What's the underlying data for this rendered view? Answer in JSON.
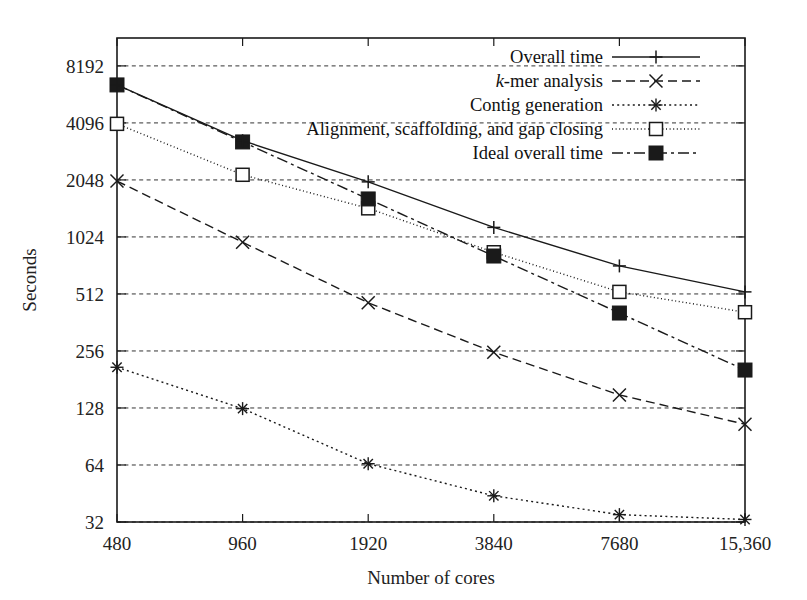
{
  "chart_data": {
    "type": "line",
    "title": "",
    "xlabel": "Number of cores",
    "ylabel": "Seconds",
    "xscale": "log2",
    "yscale": "log2",
    "grid": true,
    "legend_position": "top-right",
    "x": [
      480,
      960,
      1920,
      3840,
      7680,
      15360
    ],
    "xtick_labels": [
      "480",
      "960",
      "1920",
      "3840",
      "7680",
      "15,360"
    ],
    "ytick_values": [
      32,
      64,
      128,
      256,
      512,
      1024,
      2048,
      4096,
      8192
    ],
    "ytick_labels": [
      "32",
      "64",
      "128",
      "256",
      "512",
      "1024",
      "2048",
      "4096",
      "8192"
    ],
    "ylim": [
      32,
      11500
    ],
    "series": [
      {
        "name": "Overall time",
        "marker": "plus",
        "linestyle": "solid",
        "values": [
          6500,
          3300,
          2000,
          1150,
          720,
          525
        ]
      },
      {
        "name": "k-mer analysis",
        "marker": "cross",
        "linestyle": "dashed",
        "values": [
          2020,
          960,
          460,
          252,
          150,
          105
        ]
      },
      {
        "name": "Contig generation",
        "marker": "asterisk",
        "linestyle": "dotted",
        "values": [
          210,
          127,
          65,
          44,
          35,
          33
        ]
      },
      {
        "name": "Alignment, scaffolding, and gap closing",
        "marker": "open-square",
        "linestyle": "fine-dotted",
        "values": [
          4050,
          2180,
          1450,
          850,
          525,
          410
        ]
      },
      {
        "name": "Ideal overall time",
        "marker": "filled-square",
        "linestyle": "dash-dot",
        "values": [
          6500,
          3250,
          1625,
          812,
          406,
          203
        ]
      }
    ]
  },
  "legend": {
    "entries": [
      {
        "label": "Overall time",
        "label_prefix": "",
        "marker": "plus-icon"
      },
      {
        "label": "-mer analysis",
        "label_prefix": "k",
        "marker": "cross-icon"
      },
      {
        "label": "Contig generation",
        "label_prefix": "",
        "marker": "asterisk-icon"
      },
      {
        "label": "Alignment, scaffolding, and gap closing",
        "label_prefix": "",
        "marker": "open-square-icon"
      },
      {
        "label": "Ideal overall time",
        "label_prefix": "",
        "marker": "filled-square-icon"
      }
    ]
  },
  "axes": {
    "y_title": "Seconds",
    "x_title": "Number of cores"
  },
  "colors": {
    "foreground": "#1a1a1a",
    "grid": "#333333",
    "background": "#ffffff"
  }
}
